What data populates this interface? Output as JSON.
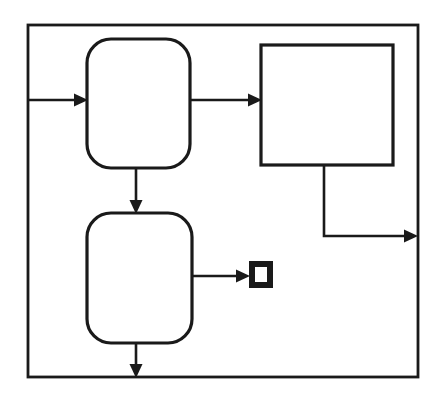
{
  "canvas": {
    "width": 437,
    "height": 399,
    "background_color": "#ffffff",
    "ink_color": "#1a1a1a"
  },
  "diagram": {
    "type": "block-diagram",
    "title": "",
    "boundary": {
      "name": "system-boundary",
      "shape": "rectangle",
      "x": 28,
      "y": 25,
      "width": 390,
      "height": 352,
      "stroke_width": 2.8
    },
    "nodes": [
      {
        "id": "node-top-rounded",
        "name": "rounded-block-top",
        "shape": "rounded-rectangle",
        "label": "",
        "x": 87,
        "y": 39,
        "width": 103,
        "height": 129,
        "corner_radius": 24,
        "fill": "#ffffff",
        "stroke_width": 3.2
      },
      {
        "id": "node-right-rect",
        "name": "square-block-right",
        "shape": "rectangle",
        "label": "",
        "x": 261,
        "y": 45,
        "width": 132,
        "height": 120,
        "corner_radius": 0,
        "fill": "#ffffff",
        "stroke_width": 3.2
      },
      {
        "id": "node-bottom-rounded",
        "name": "rounded-block-bottom",
        "shape": "rounded-rectangle",
        "label": "",
        "x": 87,
        "y": 213,
        "width": 105,
        "height": 130,
        "corner_radius": 24,
        "fill": "#ffffff",
        "stroke_width": 3.2
      },
      {
        "id": "node-terminator-square",
        "name": "filled-square-terminator",
        "shape": "thick-bordered-square",
        "label": "",
        "x": 249,
        "y": 261,
        "width": 24,
        "height": 27,
        "border_thickness": 6,
        "fill": "#1a1a1a",
        "inner_fill": "#ffffff"
      }
    ],
    "connectors": [
      {
        "id": "conn-input-to-top",
        "name": "connector-input-to-top-block",
        "from": "system-boundary-left-edge",
        "to": "node-top-rounded",
        "orientation": "horizontal",
        "points": [
          [
            29,
            100
          ],
          [
            87,
            100
          ]
        ],
        "arrowhead": "end",
        "arrow_tip": [
          87,
          100
        ]
      },
      {
        "id": "conn-top-to-right",
        "name": "connector-top-block-to-right-block",
        "from": "node-top-rounded",
        "to": "node-right-rect",
        "orientation": "horizontal",
        "points": [
          [
            190,
            100
          ],
          [
            261,
            100
          ]
        ],
        "arrowhead": "end",
        "arrow_tip": [
          261,
          100
        ]
      },
      {
        "id": "conn-top-to-bottom",
        "name": "connector-top-block-to-bottom-block",
        "from": "node-top-rounded",
        "to": "node-bottom-rounded",
        "orientation": "vertical",
        "points": [
          [
            136,
            168
          ],
          [
            136,
            213
          ]
        ],
        "arrowhead": "end",
        "arrow_tip": [
          136,
          213
        ]
      },
      {
        "id": "conn-right-to-output",
        "name": "connector-right-block-to-output",
        "from": "node-right-rect",
        "to": "system-boundary-right-edge",
        "orientation": "elbow",
        "points": [
          [
            324,
            165
          ],
          [
            324,
            236
          ],
          [
            417,
            236
          ]
        ],
        "arrowhead": "end",
        "arrow_tip": [
          417,
          236
        ]
      },
      {
        "id": "conn-bottom-to-terminator",
        "name": "connector-bottom-block-to-terminator",
        "from": "node-bottom-rounded",
        "to": "node-terminator-square",
        "orientation": "horizontal",
        "points": [
          [
            192,
            276
          ],
          [
            249,
            276
          ]
        ],
        "arrowhead": "end",
        "arrow_tip": [
          249,
          276
        ]
      },
      {
        "id": "conn-bottom-to-output",
        "name": "connector-bottom-block-to-output",
        "from": "node-bottom-rounded",
        "to": "system-boundary-bottom-edge",
        "orientation": "vertical",
        "points": [
          [
            136,
            343
          ],
          [
            136,
            377
          ]
        ],
        "arrowhead": "end",
        "arrow_tip": [
          136,
          377
        ]
      }
    ],
    "arrowhead_style": {
      "length": 13,
      "half_width": 6.5,
      "fill": "#1a1a1a"
    }
  }
}
